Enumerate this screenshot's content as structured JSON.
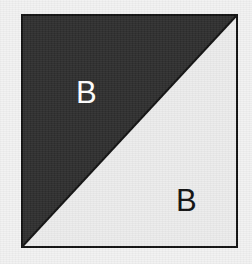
{
  "figure": {
    "type": "half-square-triangle-block",
    "background_color": "#f2f2f2",
    "border_color": "#111111",
    "border_width_px": 2,
    "square": {
      "x": 21,
      "y": 14,
      "width": 217,
      "height": 234
    },
    "diagonal": {
      "description": "diagonal from top-right corner to bottom-left corner",
      "from": "top-right",
      "to": "bottom-left"
    },
    "regions": [
      {
        "name": "upper-left-triangle",
        "fill_color": "#2e2e2e",
        "label": "B",
        "label_color": "#ffffff"
      },
      {
        "name": "lower-right-triangle",
        "fill_color": "#ececec",
        "label": "B",
        "label_color": "#111111"
      }
    ]
  }
}
